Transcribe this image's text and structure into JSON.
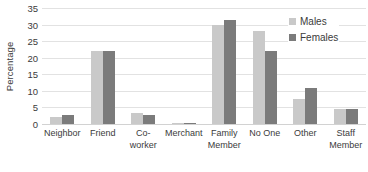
{
  "chart_data": {
    "type": "bar",
    "title": "",
    "subtitle": "",
    "xlabel": "",
    "ylabel": "Percentage",
    "ylim": [
      0,
      35
    ],
    "yticks": [
      0,
      5,
      10,
      15,
      20,
      25,
      30,
      35
    ],
    "grid": true,
    "legend_position": "top-right",
    "categories": [
      "Neighbor",
      "Friend",
      "Co-worker",
      "Merchant",
      "Family Member",
      "No One",
      "Other",
      "Staff Member"
    ],
    "series": [
      {
        "name": "Males",
        "color": "#c9c9c9",
        "values": [
          2.0,
          22.0,
          3.2,
          0.3,
          30.0,
          28.0,
          7.5,
          4.5
        ]
      },
      {
        "name": "Females",
        "color": "#7b7b7b",
        "values": [
          2.6,
          22.0,
          2.8,
          0.3,
          31.5,
          22.0,
          11.0,
          4.5
        ]
      }
    ]
  },
  "legend": {
    "items": [
      {
        "label": "Males",
        "swatch": "males"
      },
      {
        "label": "Females",
        "swatch": "females"
      }
    ]
  },
  "colors": {
    "males": "#c9c9c9",
    "females": "#7b7b7b",
    "gridline": "#e2e2e2",
    "text": "#3b3b3b",
    "background": "#ffffff"
  }
}
